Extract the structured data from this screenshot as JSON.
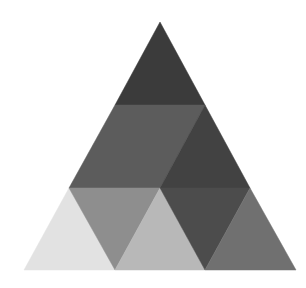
{
  "figure": {
    "width": 306,
    "height": 288,
    "background": "#ffffff",
    "regions": [
      {
        "name": "top-triangle",
        "points": "160,22 205,105 115,105",
        "fill": "#3b3b3b"
      },
      {
        "name": "middle-left-trapezoid",
        "points": "115,105 205,105 160,188 69,188",
        "fill": "#5c5c5c"
      },
      {
        "name": "middle-right-triangle",
        "points": "205,105 250,188 160,188",
        "fill": "#424242"
      },
      {
        "name": "bottom-1-up",
        "points": "69,188 115,270 24,270",
        "fill": "#e2e2e2"
      },
      {
        "name": "bottom-2-down",
        "points": "69,188 160,188 115,270",
        "fill": "#8e8e8e"
      },
      {
        "name": "bottom-3-up",
        "points": "160,188 205,270 115,270",
        "fill": "#b8b8b8"
      },
      {
        "name": "bottom-4-down",
        "points": "160,188 250,188 205,270",
        "fill": "#4c4c4c"
      },
      {
        "name": "bottom-5-up",
        "points": "250,188 296,270 205,270",
        "fill": "#707070"
      }
    ]
  }
}
